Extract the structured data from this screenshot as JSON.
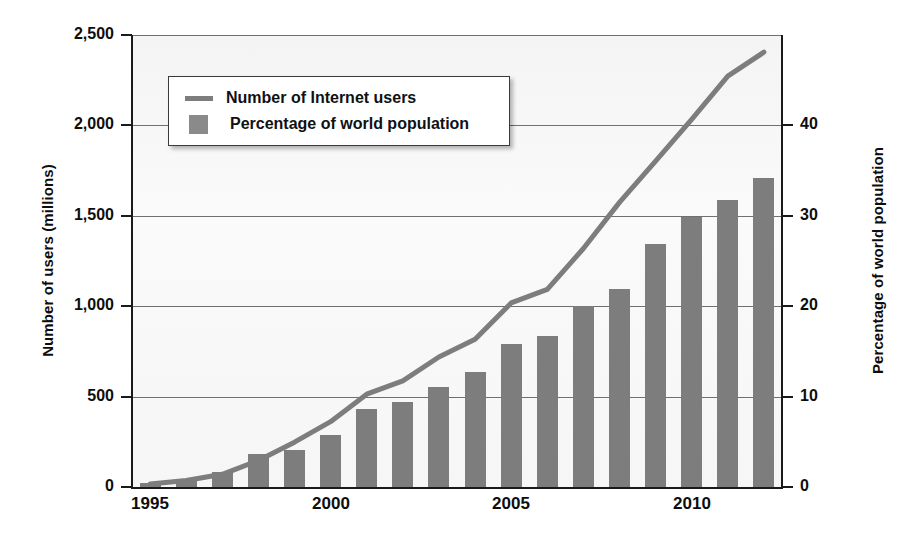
{
  "chart_data": {
    "type": "bar",
    "title": "",
    "subtitle": "",
    "xlabel": "",
    "ylabel": "Number of users (millions)",
    "y2label": "Percentage of world population",
    "grid": true,
    "legend_position": "top-left",
    "x": [
      1995,
      1996,
      1997,
      1998,
      1999,
      2000,
      2001,
      2002,
      2003,
      2004,
      2005,
      2006,
      2007,
      2008,
      2009,
      2010,
      2011,
      2012
    ],
    "categories": [
      "1995",
      "1996",
      "1997",
      "1998",
      "1999",
      "2000",
      "2001",
      "2002",
      "2003",
      "2004",
      "2005",
      "2006",
      "2007",
      "2008",
      "2009",
      "2010",
      "2011",
      "2012"
    ],
    "xtick_labels": [
      "1995",
      "2000",
      "2005",
      "2010"
    ],
    "xtick_values": [
      1995,
      2000,
      2005,
      2010
    ],
    "ylim": [
      0,
      2500
    ],
    "ytick_labels": [
      "0",
      "500",
      "1,000",
      "1,500",
      "2,000",
      "2,500"
    ],
    "ytick_values": [
      0,
      500,
      1000,
      1500,
      2000,
      2500
    ],
    "y2lim": [
      0,
      50
    ],
    "y2tick_labels": [
      "0",
      "10",
      "20",
      "30",
      "40"
    ],
    "y2tick_values": [
      0,
      10,
      20,
      30,
      40
    ],
    "series": [
      {
        "name": "Number of Internet users",
        "type": "line",
        "axis": "left",
        "unit": "millions",
        "color": "#7d7d7d",
        "values": [
          16,
          36,
          70,
          147,
          248,
          361,
          513,
          587,
          719,
          817,
          1018,
          1093,
          1319,
          1574,
          1802,
          2034,
          2272,
          2405
        ]
      },
      {
        "name": "Percentage of world population",
        "type": "bar",
        "axis": "right",
        "unit": "percent",
        "color": "#7d7d7d",
        "values": [
          0.4,
          0.9,
          1.7,
          3.6,
          4.1,
          5.8,
          8.6,
          9.4,
          11.1,
          12.7,
          15.8,
          16.7,
          20.0,
          21.9,
          26.9,
          29.9,
          31.8,
          34.2
        ]
      }
    ]
  },
  "legend": {
    "items": [
      {
        "label": "Number of Internet users",
        "marker": "line-swatch"
      },
      {
        "label": "Percentage of world population",
        "marker": "box-swatch"
      }
    ]
  },
  "colors": {
    "series_gray": "#7d7d7d",
    "axis_black": "#1a1a1a",
    "gridline": "#6f6f6f",
    "plot_background": "#f7f7f7",
    "page_background": "#ffffff"
  }
}
